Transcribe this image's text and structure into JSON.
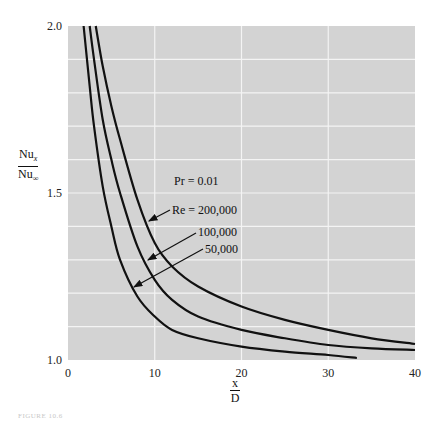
{
  "chart_data": {
    "type": "line",
    "title": "",
    "xlabel": "x/D",
    "ylabel": "Nu_x / Nu_inf",
    "xlim": [
      0,
      40
    ],
    "ylim": [
      1.0,
      2.0
    ],
    "x_ticks": [
      "0",
      "10",
      "20",
      "30",
      "40"
    ],
    "y_ticks": [
      "1.0",
      "1.5",
      "2.0"
    ],
    "grid": true,
    "grid_x_step": 10,
    "grid_y_step": 0.1,
    "annotations": [
      "Pr = 0.01",
      "Re = 200,000",
      "100,000",
      "50,000"
    ],
    "series": [
      {
        "name": "Re = 200,000",
        "x": [
          3.2,
          4,
          5,
          6,
          8,
          10,
          12,
          15,
          20,
          25,
          30,
          35,
          40
        ],
        "y": [
          2.0,
          1.88,
          1.76,
          1.66,
          1.48,
          1.35,
          1.28,
          1.22,
          1.16,
          1.12,
          1.09,
          1.065,
          1.048
        ]
      },
      {
        "name": "100,000",
        "x": [
          2.5,
          3,
          4,
          5,
          6,
          8,
          10,
          12,
          15,
          20,
          25,
          30,
          35,
          40
        ],
        "y": [
          2.0,
          1.9,
          1.72,
          1.6,
          1.5,
          1.34,
          1.24,
          1.18,
          1.13,
          1.09,
          1.065,
          1.045,
          1.035,
          1.03
        ]
      },
      {
        "name": "50,000",
        "x": [
          1.8,
          2.5,
          3,
          4,
          5,
          6,
          8,
          10,
          12,
          15,
          20,
          25,
          30,
          33.3
        ],
        "y": [
          2.0,
          1.82,
          1.7,
          1.52,
          1.4,
          1.3,
          1.19,
          1.13,
          1.09,
          1.065,
          1.04,
          1.025,
          1.015,
          1.006
        ]
      }
    ]
  },
  "labels": {
    "y_num": "Nu",
    "y_num_sub": "x",
    "y_den": "Nu",
    "y_den_sub": "∞",
    "x_num": "x",
    "x_den": "D",
    "caption": "FIGURE 10.6"
  },
  "colors": {
    "plot_bg": "#d3d3d3",
    "grid": "#f4f4f4",
    "curve": "#111111"
  }
}
